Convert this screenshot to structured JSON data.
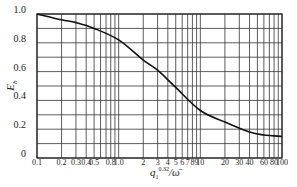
{
  "chart_data": {
    "type": "line",
    "title": "",
    "xlabel": "q1^0.32/ω̄",
    "xlabel_parts": {
      "base": "q",
      "sub": "1",
      "sup": "0.32",
      "rest": "/ω̄"
    },
    "ylabel": "Eb",
    "ylabel_parts": {
      "base": "E",
      "sub": "b"
    },
    "xscale": "log",
    "xlim": [
      0.1,
      100
    ],
    "ylim": [
      0,
      1.0
    ],
    "grid": true,
    "x_ticks": [
      "0.1",
      "0.2",
      "0.3",
      "0.4",
      "0.5",
      "0.8",
      "1.0",
      "2",
      "3",
      "4",
      "5",
      "6",
      "7",
      "8",
      "9",
      "10",
      "20",
      "30",
      "40",
      "60",
      "80",
      "100"
    ],
    "x_tick_values": [
      0.1,
      0.2,
      0.3,
      0.4,
      0.5,
      0.8,
      1.0,
      2,
      3,
      4,
      5,
      6,
      7,
      8,
      9,
      10,
      20,
      30,
      40,
      60,
      80,
      100
    ],
    "x_gridlines": [
      0.1,
      0.2,
      0.3,
      0.4,
      0.5,
      0.6,
      0.7,
      0.8,
      0.9,
      1,
      2,
      3,
      4,
      5,
      6,
      7,
      8,
      9,
      10,
      20,
      30,
      40,
      50,
      60,
      70,
      80,
      90,
      100
    ],
    "y_ticks": [
      "0",
      "0.2",
      "0.4",
      "0.6",
      "0.8",
      "1.0"
    ],
    "y_tick_values": [
      0,
      0.2,
      0.4,
      0.6,
      0.8,
      1.0
    ],
    "y_gridlines": [
      0,
      0.1,
      0.2,
      0.3,
      0.4,
      0.5,
      0.6,
      0.7,
      0.8,
      0.9,
      1.0
    ],
    "series": [
      {
        "name": "Eb",
        "x": [
          0.1,
          0.2,
          0.3,
          0.5,
          1.0,
          2,
          3,
          5,
          10,
          20,
          40,
          60,
          100
        ],
        "y": [
          1.0,
          0.96,
          0.94,
          0.9,
          0.82,
          0.68,
          0.61,
          0.49,
          0.33,
          0.25,
          0.18,
          0.16,
          0.15
        ]
      }
    ],
    "legend": null
  }
}
